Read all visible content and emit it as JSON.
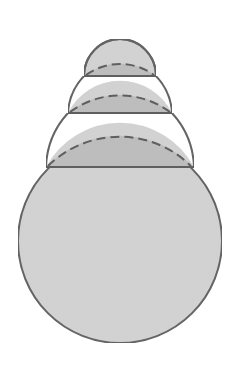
{
  "diagram": {
    "title": "",
    "colors": {
      "background": "#ffffff",
      "fill_light": "#d3d3d3",
      "fill_dark": "#bdbdbd",
      "stroke": "#5f5f5f"
    },
    "center_x": 120,
    "chords": [
      {
        "id": "chord-1",
        "y": 76,
        "x1": 84,
        "x2": 156
      },
      {
        "id": "chord-2",
        "y": 113,
        "x1": 68,
        "x2": 172
      },
      {
        "id": "chord-3",
        "y": 167,
        "x1": 46,
        "x2": 193
      }
    ],
    "caps": [
      {
        "id": "cap-1",
        "top_y": 39,
        "dashed_peak_y": 61
      },
      {
        "id": "cap-2",
        "dashed_peak_y": 92
      },
      {
        "id": "cap-3",
        "dashed_peak_y": 134
      }
    ],
    "big_circle": {
      "cx": 120,
      "cy": 241,
      "r": 102
    }
  }
}
